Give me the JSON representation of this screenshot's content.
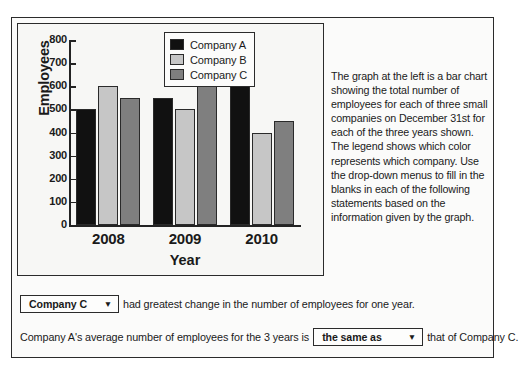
{
  "chart_data": {
    "type": "bar",
    "title": "",
    "xlabel": "Year",
    "ylabel": "Employees",
    "categories": [
      "2008",
      "2009",
      "2010"
    ],
    "yticks": [
      0,
      100,
      200,
      300,
      400,
      500,
      600,
      700,
      800
    ],
    "ylim": [
      0,
      800
    ],
    "grid": false,
    "legend_position": "top-right",
    "series": [
      {
        "name": "Company A",
        "color": "#111111",
        "values": [
          500,
          550,
          600
        ]
      },
      {
        "name": "Company B",
        "color": "#c6c6c6",
        "values": [
          600,
          500,
          400
        ]
      },
      {
        "name": "Company C",
        "color": "#7f7f7f",
        "values": [
          550,
          650,
          450
        ]
      }
    ]
  },
  "description": {
    "text": "The graph at the left is a bar chart showing the total number of employees for each of three small companies on December 31st for each of the three years shown. The legend shows which color represents which company. Use the drop-down menus to fill in the blanks in each of the following statements based on the information given by the graph."
  },
  "statements": {
    "first": {
      "dropdown_value": "Company C",
      "caret": "▼",
      "text_after": "had greatest change in the number of employees for one year."
    },
    "second": {
      "text_before": "Company A's average number of employees for the 3 years is",
      "dropdown_value": "the same as",
      "caret": "▼",
      "text_after": "that of Company C."
    }
  }
}
